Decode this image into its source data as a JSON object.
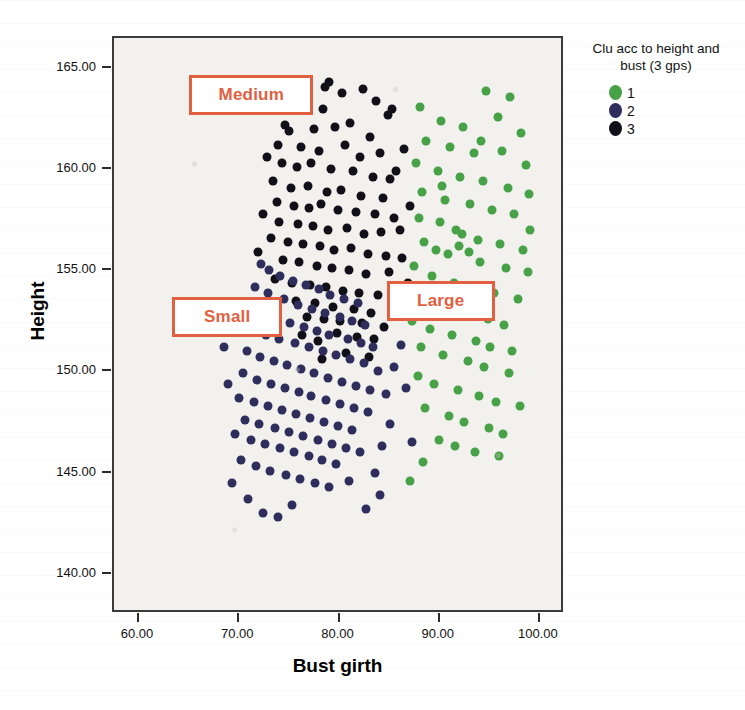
{
  "chart_data": {
    "type": "scatter",
    "title": "",
    "xlabel": "Bust girth",
    "ylabel": "Height",
    "xlim": [
      57.5,
      102.5
    ],
    "ylim": [
      138.0,
      166.5
    ],
    "xticks": [
      "60.00",
      "70.00",
      "80.00",
      "90.00",
      "100.00"
    ],
    "xtick_values": [
      60,
      70,
      80,
      90,
      100
    ],
    "yticks": [
      "140.00",
      "145.00",
      "150.00",
      "155.00",
      "160.00",
      "165.00"
    ],
    "ytick_values": [
      140,
      145,
      150,
      155,
      160,
      165
    ],
    "grid": false,
    "legend": {
      "position": "right",
      "title": "Clu acc to height and\nbust (3 gps)",
      "entries": [
        {
          "label": "1",
          "color": "#47a147"
        },
        {
          "label": "2",
          "color": "#2e2d5c"
        },
        {
          "label": "3",
          "color": "#111018"
        }
      ]
    },
    "annotations": [
      {
        "text": "Medium",
        "x": 71.4,
        "y": 163.6,
        "w": 124,
        "h": 40,
        "color": "#e2603f"
      },
      {
        "text": "Small",
        "x": 69.0,
        "y": 152.6,
        "w": 110,
        "h": 40,
        "color": "#e2603f"
      },
      {
        "text": "Large",
        "x": 90.3,
        "y": 153.4,
        "w": 108,
        "h": 40,
        "color": "#e2603f"
      }
    ],
    "series": [
      {
        "name": "3",
        "label": "Medium",
        "color": "#111018",
        "points": [
          [
            78.6,
            164.1
          ],
          [
            79.0,
            164.3
          ],
          [
            80.2,
            163.8
          ],
          [
            82.3,
            164.0
          ],
          [
            83.6,
            163.4
          ],
          [
            76.6,
            163.3
          ],
          [
            78.4,
            163.0
          ],
          [
            84.8,
            162.7
          ],
          [
            85.2,
            163.0
          ],
          [
            81.0,
            162.3
          ],
          [
            74.6,
            162.2
          ],
          [
            75.0,
            161.9
          ],
          [
            77.5,
            162.0
          ],
          [
            79.6,
            162.1
          ],
          [
            83.0,
            161.6
          ],
          [
            73.9,
            161.2
          ],
          [
            76.2,
            161.1
          ],
          [
            78.0,
            160.9
          ],
          [
            80.5,
            161.2
          ],
          [
            82.0,
            160.6
          ],
          [
            84.0,
            160.8
          ],
          [
            74.3,
            160.3
          ],
          [
            75.8,
            160.1
          ],
          [
            77.2,
            160.3
          ],
          [
            79.2,
            160.0
          ],
          [
            81.3,
            159.9
          ],
          [
            83.3,
            159.6
          ],
          [
            85.0,
            159.5
          ],
          [
            73.4,
            159.4
          ],
          [
            75.2,
            159.1
          ],
          [
            76.9,
            159.2
          ],
          [
            78.8,
            158.9
          ],
          [
            80.1,
            159.0
          ],
          [
            82.1,
            158.7
          ],
          [
            84.3,
            158.6
          ],
          [
            73.8,
            158.4
          ],
          [
            75.5,
            158.2
          ],
          [
            77.0,
            158.1
          ],
          [
            78.2,
            158.3
          ],
          [
            79.9,
            158.0
          ],
          [
            81.6,
            157.9
          ],
          [
            83.5,
            157.8
          ],
          [
            85.4,
            157.6
          ],
          [
            74.0,
            157.4
          ],
          [
            75.9,
            157.3
          ],
          [
            77.4,
            157.2
          ],
          [
            78.9,
            157.0
          ],
          [
            80.7,
            157.1
          ],
          [
            82.4,
            156.8
          ],
          [
            84.1,
            156.9
          ],
          [
            73.2,
            156.6
          ],
          [
            74.9,
            156.4
          ],
          [
            76.4,
            156.3
          ],
          [
            78.1,
            156.2
          ],
          [
            79.5,
            156.0
          ],
          [
            81.1,
            156.1
          ],
          [
            82.8,
            155.8
          ],
          [
            84.6,
            155.7
          ],
          [
            74.4,
            155.5
          ],
          [
            76.0,
            155.4
          ],
          [
            77.8,
            155.2
          ],
          [
            79.3,
            155.1
          ],
          [
            80.9,
            155.0
          ],
          [
            82.6,
            154.8
          ],
          [
            84.9,
            154.9
          ],
          [
            73.6,
            154.6
          ],
          [
            75.3,
            154.4
          ],
          [
            77.1,
            154.3
          ],
          [
            78.7,
            154.2
          ],
          [
            80.3,
            154.0
          ],
          [
            81.9,
            153.9
          ],
          [
            83.8,
            153.8
          ],
          [
            75.7,
            153.5
          ],
          [
            77.6,
            153.4
          ],
          [
            79.4,
            153.2
          ],
          [
            81.4,
            153.1
          ],
          [
            83.1,
            152.9
          ],
          [
            76.8,
            152.7
          ],
          [
            78.5,
            152.6
          ],
          [
            80.0,
            152.5
          ],
          [
            82.2,
            152.4
          ],
          [
            84.4,
            152.2
          ],
          [
            86.2,
            155.6
          ],
          [
            86.0,
            157.0
          ],
          [
            85.6,
            159.9
          ],
          [
            86.4,
            161.0
          ],
          [
            87.0,
            158.2
          ],
          [
            72.8,
            160.6
          ],
          [
            72.4,
            157.8
          ],
          [
            71.9,
            155.9
          ],
          [
            86.8,
            154.4
          ],
          [
            85.9,
            153.3
          ],
          [
            79.8,
            151.9
          ],
          [
            81.7,
            151.7
          ],
          [
            83.4,
            151.6
          ],
          [
            77.9,
            151.5
          ],
          [
            76.3,
            151.8
          ],
          [
            80.6,
            150.9
          ],
          [
            82.9,
            150.7
          ],
          [
            78.3,
            150.6
          ]
        ]
      },
      {
        "name": "2",
        "label": "Small",
        "color": "#2e2d5c",
        "points": [
          [
            72.2,
            155.3
          ],
          [
            73.0,
            155.0
          ],
          [
            74.1,
            154.7
          ],
          [
            75.4,
            154.5
          ],
          [
            76.7,
            154.3
          ],
          [
            78.0,
            154.1
          ],
          [
            79.1,
            153.8
          ],
          [
            80.4,
            153.6
          ],
          [
            81.8,
            153.4
          ],
          [
            71.6,
            154.2
          ],
          [
            72.9,
            153.9
          ],
          [
            74.5,
            153.6
          ],
          [
            75.9,
            153.3
          ],
          [
            77.3,
            153.1
          ],
          [
            78.6,
            152.9
          ],
          [
            80.0,
            152.7
          ],
          [
            81.2,
            152.5
          ],
          [
            82.5,
            152.3
          ],
          [
            71.1,
            153.2
          ],
          [
            72.5,
            152.9
          ],
          [
            73.8,
            152.6
          ],
          [
            75.1,
            152.4
          ],
          [
            76.5,
            152.2
          ],
          [
            77.8,
            152.0
          ],
          [
            79.0,
            151.8
          ],
          [
            80.8,
            151.6
          ],
          [
            82.1,
            151.4
          ],
          [
            83.3,
            151.2
          ],
          [
            71.4,
            152.1
          ],
          [
            72.7,
            151.8
          ],
          [
            74.0,
            151.6
          ],
          [
            75.6,
            151.4
          ],
          [
            77.0,
            151.2
          ],
          [
            78.4,
            151.0
          ],
          [
            79.7,
            150.8
          ],
          [
            81.0,
            150.6
          ],
          [
            82.4,
            150.4
          ],
          [
            70.8,
            151.0
          ],
          [
            72.1,
            150.7
          ],
          [
            73.5,
            150.5
          ],
          [
            74.8,
            150.3
          ],
          [
            76.2,
            150.1
          ],
          [
            77.5,
            149.9
          ],
          [
            78.9,
            149.7
          ],
          [
            80.2,
            149.5
          ],
          [
            81.6,
            149.3
          ],
          [
            83.0,
            149.1
          ],
          [
            70.4,
            149.9
          ],
          [
            71.8,
            149.6
          ],
          [
            73.2,
            149.4
          ],
          [
            74.6,
            149.2
          ],
          [
            76.0,
            149.0
          ],
          [
            77.2,
            148.8
          ],
          [
            78.7,
            148.6
          ],
          [
            80.0,
            148.4
          ],
          [
            81.4,
            148.2
          ],
          [
            82.8,
            148.0
          ],
          [
            70.0,
            148.7
          ],
          [
            71.5,
            148.5
          ],
          [
            72.9,
            148.3
          ],
          [
            74.3,
            148.1
          ],
          [
            75.7,
            147.9
          ],
          [
            77.1,
            147.7
          ],
          [
            78.5,
            147.5
          ],
          [
            79.9,
            147.3
          ],
          [
            81.2,
            147.1
          ],
          [
            70.6,
            147.6
          ],
          [
            72.0,
            147.4
          ],
          [
            73.6,
            147.2
          ],
          [
            75.0,
            147.0
          ],
          [
            76.4,
            146.8
          ],
          [
            77.9,
            146.6
          ],
          [
            79.3,
            146.4
          ],
          [
            80.6,
            146.2
          ],
          [
            82.0,
            146.0
          ],
          [
            69.6,
            146.9
          ],
          [
            71.2,
            146.6
          ],
          [
            72.6,
            146.4
          ],
          [
            74.1,
            146.2
          ],
          [
            75.5,
            146.0
          ],
          [
            77.0,
            145.8
          ],
          [
            78.3,
            145.6
          ],
          [
            79.7,
            145.4
          ],
          [
            70.2,
            145.6
          ],
          [
            71.7,
            145.3
          ],
          [
            73.1,
            145.1
          ],
          [
            74.7,
            144.9
          ],
          [
            76.1,
            144.7
          ],
          [
            77.6,
            144.5
          ],
          [
            79.0,
            144.3
          ],
          [
            80.9,
            144.6
          ],
          [
            83.5,
            145.0
          ],
          [
            84.2,
            146.3
          ],
          [
            85.0,
            147.4
          ],
          [
            84.6,
            148.9
          ],
          [
            85.4,
            150.2
          ],
          [
            86.1,
            151.3
          ],
          [
            69.3,
            144.5
          ],
          [
            70.9,
            143.7
          ],
          [
            72.4,
            143.0
          ],
          [
            73.9,
            142.8
          ],
          [
            75.3,
            143.4
          ],
          [
            82.6,
            143.2
          ],
          [
            84.0,
            143.9
          ],
          [
            86.6,
            149.2
          ],
          [
            87.2,
            146.5
          ],
          [
            68.9,
            149.4
          ],
          [
            68.5,
            151.2
          ],
          [
            69.0,
            153.0
          ],
          [
            83.8,
            150.0
          ]
        ]
      },
      {
        "name": "1",
        "label": "Large",
        "color": "#47a147",
        "points": [
          [
            88.0,
            163.1
          ],
          [
            94.6,
            163.9
          ],
          [
            97.0,
            163.6
          ],
          [
            90.1,
            162.4
          ],
          [
            92.3,
            162.1
          ],
          [
            95.8,
            162.6
          ],
          [
            98.1,
            161.8
          ],
          [
            88.6,
            161.4
          ],
          [
            91.0,
            161.1
          ],
          [
            93.4,
            160.8
          ],
          [
            96.2,
            160.9
          ],
          [
            98.6,
            160.2
          ],
          [
            87.6,
            160.3
          ],
          [
            89.8,
            159.9
          ],
          [
            92.0,
            159.6
          ],
          [
            94.3,
            159.4
          ],
          [
            96.8,
            159.1
          ],
          [
            98.9,
            158.8
          ],
          [
            88.2,
            158.9
          ],
          [
            90.5,
            158.5
          ],
          [
            93.0,
            158.3
          ],
          [
            95.2,
            158.0
          ],
          [
            97.4,
            157.8
          ],
          [
            87.9,
            157.6
          ],
          [
            90.0,
            157.4
          ],
          [
            91.6,
            157.0
          ],
          [
            92.2,
            156.8
          ],
          [
            93.8,
            156.5
          ],
          [
            96.0,
            156.3
          ],
          [
            98.3,
            156.0
          ],
          [
            88.4,
            156.4
          ],
          [
            89.6,
            156.0
          ],
          [
            90.8,
            155.8
          ],
          [
            94.0,
            155.4
          ],
          [
            96.6,
            155.1
          ],
          [
            98.8,
            154.9
          ],
          [
            87.4,
            155.2
          ],
          [
            89.2,
            154.7
          ],
          [
            91.4,
            154.4
          ],
          [
            93.2,
            154.2
          ],
          [
            95.4,
            153.9
          ],
          [
            97.8,
            153.6
          ],
          [
            88.8,
            153.4
          ],
          [
            90.6,
            153.1
          ],
          [
            92.6,
            152.8
          ],
          [
            94.8,
            152.6
          ],
          [
            96.4,
            152.3
          ],
          [
            87.2,
            152.5
          ],
          [
            89.0,
            152.1
          ],
          [
            91.2,
            151.8
          ],
          [
            93.6,
            151.5
          ],
          [
            95.0,
            151.2
          ],
          [
            97.2,
            151.0
          ],
          [
            88.1,
            151.2
          ],
          [
            90.3,
            150.8
          ],
          [
            92.8,
            150.5
          ],
          [
            94.4,
            150.2
          ],
          [
            96.9,
            149.9
          ],
          [
            87.8,
            149.8
          ],
          [
            89.4,
            149.4
          ],
          [
            91.8,
            149.1
          ],
          [
            93.9,
            148.8
          ],
          [
            95.6,
            148.5
          ],
          [
            98.0,
            148.3
          ],
          [
            88.5,
            148.2
          ],
          [
            90.9,
            147.8
          ],
          [
            92.4,
            147.5
          ],
          [
            94.9,
            147.2
          ],
          [
            96.3,
            146.9
          ],
          [
            89.9,
            146.6
          ],
          [
            91.5,
            146.3
          ],
          [
            93.5,
            146.0
          ],
          [
            95.9,
            145.8
          ],
          [
            87.0,
            144.6
          ],
          [
            88.3,
            145.5
          ],
          [
            92.9,
            155.9
          ],
          [
            91.9,
            156.2
          ],
          [
            90.2,
            159.2
          ],
          [
            94.1,
            161.4
          ],
          [
            99.0,
            157.0
          ]
        ]
      }
    ]
  }
}
